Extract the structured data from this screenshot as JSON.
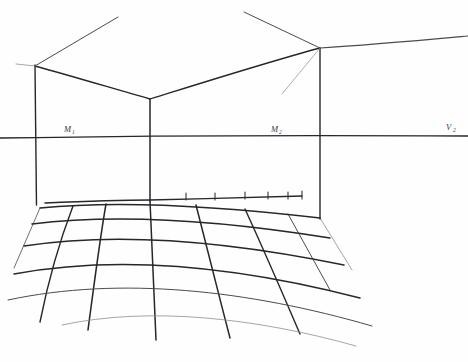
{
  "figure": {
    "background_color": "#fefefe",
    "ink_color": "#2e2e33",
    "width": 468,
    "height": 362
  },
  "labels": [
    {
      "id": "m1",
      "base": "M",
      "sub": "1",
      "x": 66,
      "y": 131,
      "name": "measuring-point-1-label"
    },
    {
      "id": "m2",
      "base": "M",
      "sub": "2",
      "x": 272,
      "y": 131,
      "name": "measuring-point-2-label"
    },
    {
      "id": "v2",
      "base": "V",
      "sub": "2",
      "x": 447,
      "y": 131,
      "name": "vanishing-point-2-label"
    }
  ],
  "construction": {
    "horizon_line": {
      "name": "horizon-line",
      "y": 137,
      "x_start": 0,
      "x_end": 468
    },
    "verticals": [
      {
        "name": "left-wall-vertical",
        "x": 35,
        "y_top": 67,
        "y_bottom": 205
      },
      {
        "name": "center-corner-vertical",
        "x": 150,
        "y_top": 99,
        "y_bottom": 200
      },
      {
        "name": "right-wall-vertical",
        "x": 320,
        "y_top": 48,
        "y_bottom": 218
      }
    ],
    "ceiling_edges": [
      {
        "name": "ceiling-left-edge",
        "from": [
          35,
          67
        ],
        "to": [
          150,
          99
        ]
      },
      {
        "name": "ceiling-right-edge",
        "from": [
          150,
          99
        ],
        "to": [
          320,
          48
        ]
      },
      {
        "name": "ceiling-left-receding-ray",
        "from": [
          35,
          67
        ],
        "to": [
          118,
          17
        ]
      },
      {
        "name": "ceiling-back-receding-ray",
        "from": [
          320,
          48
        ],
        "to": [
          244,
          12
        ]
      },
      {
        "name": "ceiling-right-receding-ray",
        "from": [
          320,
          48
        ],
        "to": [
          468,
          38
        ]
      }
    ],
    "baseline": {
      "name": "floor-baseline",
      "from": [
        45,
        203
      ],
      "corner": [
        150,
        200
      ],
      "to": [
        302,
        196
      ]
    },
    "baseline_ticks": [
      {
        "x": 186,
        "y": 197
      },
      {
        "x": 215,
        "y": 197
      },
      {
        "x": 245,
        "y": 196
      },
      {
        "x": 268,
        "y": 196
      },
      {
        "x": 288,
        "y": 196
      },
      {
        "x": 302,
        "y": 196
      }
    ],
    "floor_grid": {
      "name": "perspective-floor-grid",
      "rows": 4,
      "columns": 5,
      "near_left": [
        75,
        305
      ],
      "near_right": [
        300,
        272
      ],
      "far_left": [
        40,
        208
      ],
      "far_right": [
        320,
        218
      ]
    }
  },
  "notes": {
    "drawing_type": "hand-drawn pencil perspective diagram",
    "visible_elements": "room corner walls, ceiling edges, horizon line with measuring points, tiled floor grid"
  }
}
